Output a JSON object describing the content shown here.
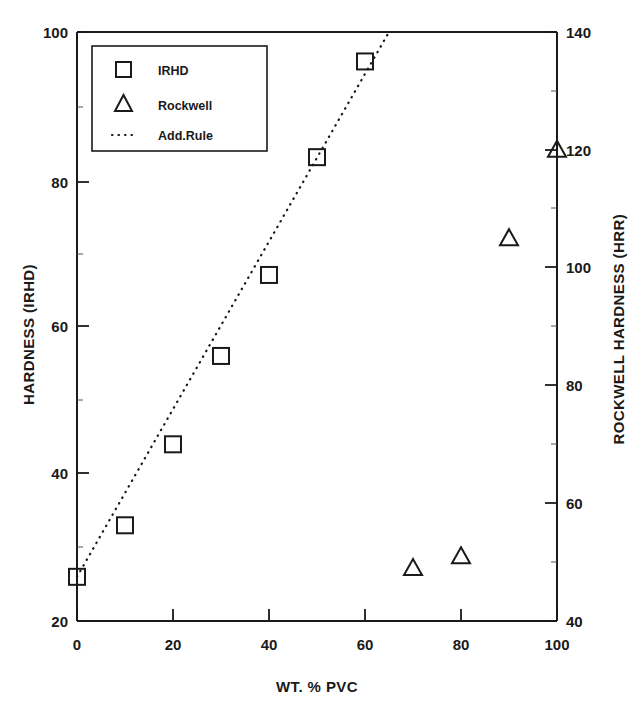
{
  "chart_data": {
    "type": "scatter",
    "title": "",
    "xlabel": "WT. % PVC",
    "ylabel": "HARDNESS (IRHD)",
    "ylabel_right": "ROCKWELL HARDNESS (HRR)",
    "xlim": [
      0,
      100
    ],
    "ylim": [
      20,
      100
    ],
    "ylim_right": [
      40,
      140
    ],
    "xticks": [
      "0",
      "20",
      "40",
      "60",
      "80",
      "100"
    ],
    "xtick_values": [
      0,
      20,
      40,
      60,
      80,
      100
    ],
    "yticks": [
      "20",
      "40",
      "60",
      "80",
      "100"
    ],
    "ytick_values": [
      20,
      40,
      60,
      80,
      100
    ],
    "yticks_right": [
      "40",
      "60",
      "80",
      "100",
      "120",
      "140"
    ],
    "ytick_values_right": [
      40,
      60,
      80,
      100,
      120,
      140
    ],
    "grid": false,
    "legend_position": "upper left",
    "series": [
      {
        "name": "IRHD",
        "marker": "square",
        "axis": "left",
        "x": [
          0,
          10,
          20,
          30,
          40,
          50,
          60
        ],
        "values": [
          26,
          33,
          44,
          56,
          67,
          83,
          96
        ]
      },
      {
        "name": "Rockwell",
        "marker": "triangle",
        "axis": "right",
        "x": [
          70,
          80,
          90,
          100
        ],
        "values": [
          49,
          51,
          105,
          120
        ]
      },
      {
        "name": "Add.Rule",
        "marker": "dotted-line",
        "axis": "left",
        "x": [
          0,
          65
        ],
        "values": [
          26,
          100
        ]
      }
    ]
  },
  "legend": {
    "entries": [
      {
        "label": "IRHD",
        "icon": "square-marker-icon"
      },
      {
        "label": "Rockwell",
        "icon": "triangle-marker-icon"
      },
      {
        "label": "Add.Rule",
        "icon": "dotted-line-icon"
      }
    ]
  },
  "colors": {
    "ink": "#1a1a1a",
    "background": "#ffffff"
  }
}
